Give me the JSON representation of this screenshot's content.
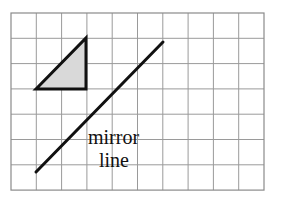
{
  "figure": {
    "background_color": "#ffffff",
    "width": 281,
    "height": 208
  },
  "grid": {
    "origin_x": 11,
    "origin_y": 13,
    "cell_size": 25.3,
    "columns": 10,
    "rows": 7,
    "line_color": "#9a9a9a",
    "border_color": "#8a8a8a",
    "line_width": 1
  },
  "shape": {
    "name": "right-triangle",
    "fill_color": "#d9d9d9",
    "stroke_color": "#111111",
    "stroke_width": 3,
    "points": "36,89 86,38 86,89",
    "vertices": [
      {
        "x": 36,
        "y": 89
      },
      {
        "x": 86,
        "y": 38
      },
      {
        "x": 86,
        "y": 89
      }
    ]
  },
  "mirror_line": {
    "stroke_color": "#111111",
    "stroke_width": 3,
    "x1": 36,
    "y1": 172,
    "x2": 163,
    "y2": 42
  },
  "labels": {
    "mirror": "mirror",
    "line": "line",
    "mirror_x": 88,
    "mirror_y": 144,
    "line_x": 99,
    "line_y": 167
  }
}
